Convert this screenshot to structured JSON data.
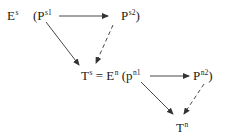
{
  "diagram": {
    "top": {
      "space": {
        "base": "E",
        "sup": "s"
      },
      "open_paren": "(",
      "node1": {
        "base": "P",
        "sup": "s1"
      },
      "node2": {
        "base": "P",
        "sup": "s2"
      },
      "close_paren": ")"
    },
    "middle": {
      "target": {
        "base": "T",
        "sup": "s"
      },
      "equals": "=",
      "space": {
        "base": "E",
        "sup": "n"
      },
      "open_paren": "(",
      "node1": {
        "base": "p",
        "sup": "n1"
      },
      "node2": {
        "base": "P",
        "sup": "n2"
      },
      "close_paren": ")"
    },
    "bottom": {
      "target": {
        "base": "T",
        "sup": "n"
      }
    },
    "edges": [
      {
        "from": "P^s1",
        "to": "P^s2",
        "style": "solid"
      },
      {
        "from": "P^s1",
        "to": "T^s",
        "style": "solid"
      },
      {
        "from": "P^s2",
        "to": "T^s",
        "style": "dashed"
      },
      {
        "from": "p^n1",
        "to": "P^n2",
        "style": "solid"
      },
      {
        "from": "p^n1",
        "to": "T^n",
        "style": "solid"
      },
      {
        "from": "P^n2",
        "to": "T^n",
        "style": "dashed"
      }
    ],
    "colors": {
      "line": "#333333",
      "text": "#222222",
      "background": "#ffffff"
    }
  }
}
